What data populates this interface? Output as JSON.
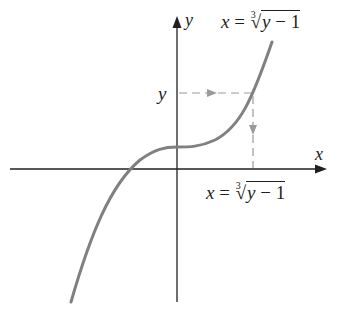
{
  "diagram": {
    "title": "",
    "axes": {
      "x_label": "x",
      "y_label": "y"
    },
    "labels": {
      "top_equation": {
        "var": "x",
        "equals": "=",
        "index": "3",
        "radical_symbol": "√",
        "radicand_var": "y",
        "radicand_rest": " − 1"
      },
      "bottom_equation": {
        "var": "x",
        "equals": "=",
        "index": "3",
        "radical_symbol": "√",
        "radicand_var": "y",
        "radicand_rest": " − 1"
      },
      "y_value_marker": "y"
    },
    "colors": {
      "axis": "#231f20",
      "curve": "#808080",
      "dashed": "#9a9a9a",
      "text": "#231f20"
    }
  }
}
